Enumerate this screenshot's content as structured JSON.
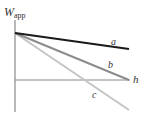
{
  "figure": {
    "ylabel_main": "W",
    "ylabel_sub": "app",
    "xlabel": "h",
    "lines": [
      {
        "label": "a",
        "color": "#1a1a1a",
        "x1": 15,
        "y1": 33,
        "x2": 129,
        "y2": 49,
        "width": 2.2
      },
      {
        "label": "b",
        "color": "#8c8c8c",
        "x1": 15,
        "y1": 33,
        "x2": 129,
        "y2": 80,
        "width": 2
      },
      {
        "label": "c",
        "color": "#c4c4c4",
        "x1": 15,
        "y1": 33,
        "x2": 129,
        "y2": 110,
        "width": 2
      }
    ],
    "axes": {
      "color": "#8a8a8a",
      "vertical": {
        "x": 15,
        "y1": 20,
        "y2": 112
      },
      "horizontal": {
        "y": 80,
        "x1": 15,
        "x2": 130
      }
    }
  },
  "chart_data": {
    "type": "line",
    "title": "",
    "xlabel": "h",
    "ylabel": "W_app",
    "grid": false,
    "legend": "inline labels",
    "series": [
      {
        "name": "a",
        "x": [
          0,
          1
        ],
        "y": [
          1,
          0.72
        ],
        "note": "shallow negative slope, stays above h-axis"
      },
      {
        "name": "b",
        "x": [
          0,
          1
        ],
        "y": [
          1,
          0.0
        ],
        "note": "medium negative slope, reaches h-axis at right end"
      },
      {
        "name": "c",
        "x": [
          0,
          1
        ],
        "y": [
          1,
          -0.64
        ],
        "note": "steep negative slope, crosses h-axis at ~x=0.61"
      }
    ]
  }
}
